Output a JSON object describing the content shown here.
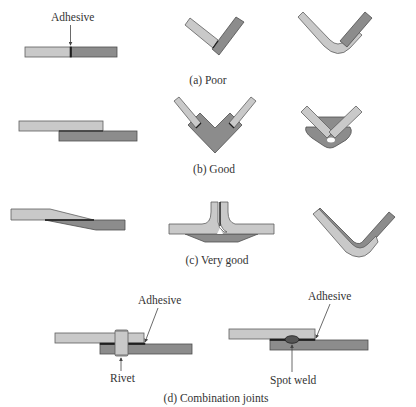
{
  "figure": {
    "colors": {
      "light_part": "#c9c9c9",
      "dark_part": "#8c8c8c",
      "adhesive": "#1e1e1e",
      "outline": "#5e5e5e",
      "text": "#333333",
      "background": "#ffffff"
    },
    "rows": [
      {
        "id": "a",
        "caption": "(a) Poor",
        "joints": [
          "butt joint",
          "corner butt joint",
          "bent corner lap"
        ],
        "labels": [
          "Adhesive"
        ]
      },
      {
        "id": "b",
        "caption": "(b) Good",
        "joints": [
          "simple lap joint",
          "corner block joint",
          "corner strap joint"
        ],
        "labels": []
      },
      {
        "id": "c",
        "caption": "(c) Very good",
        "joints": [
          "tapered lap joint",
          "T joint with backing strap",
          "nested corner joint"
        ],
        "labels": []
      },
      {
        "id": "d",
        "caption": "(d) Combination joints",
        "joints": [
          "adhesive + rivet",
          "adhesive + spot weld"
        ],
        "labels": [
          "Adhesive",
          "Rivet",
          "Adhesive",
          "Spot weld"
        ]
      }
    ]
  }
}
